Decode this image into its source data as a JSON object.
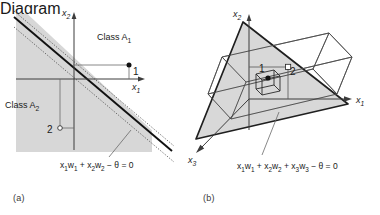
{
  "figure": {
    "background_color": "#ffffff",
    "fill_gray": "#d7d7d7",
    "line_color": "#1a1a1a",
    "panels": [
      {
        "id": "a",
        "caption": "(a)",
        "kind": "2d-linear-separation",
        "axes": [
          {
            "name": "x1-axis",
            "label_html": "x<sub>1</sub>",
            "label_text": "x1",
            "direction": "right"
          },
          {
            "name": "x2-axis",
            "label_html": "x<sub>2</sub>",
            "label_text": "x2",
            "direction": "up"
          }
        ],
        "regions": [
          {
            "name": "class-a1",
            "label_html": "Class A<sub>1</sub>",
            "label_text": "Class A1",
            "side": "upper-right"
          },
          {
            "name": "class-a2",
            "label_html": "Class A<sub>2</sub>",
            "label_text": "Class A2",
            "side": "lower-left"
          }
        ],
        "points": [
          {
            "name": "point-1",
            "label": "1",
            "marker": "filled-dot",
            "class": "A1"
          },
          {
            "name": "point-2",
            "label": "2",
            "marker": "open-dot",
            "class": "A2"
          }
        ],
        "equation_html": "x<sub>1</sub>w<sub>1</sub> + x<sub>2</sub>w<sub>2</sub> &minus; &theta; = 0",
        "equation_text": "x1w1 + x2w2 - θ = 0",
        "decision_line": {
          "name": "decision-boundary-line",
          "style": "solid-thick"
        },
        "margin_lines": {
          "name": "margin-dotted-lines",
          "style": "dotted",
          "count": 2
        }
      },
      {
        "id": "b",
        "caption": "(b)",
        "kind": "3d-linear-separation",
        "axes": [
          {
            "name": "x1-axis",
            "label_html": "x<sub>1</sub>",
            "label_text": "x1",
            "direction": "right"
          },
          {
            "name": "x2-axis",
            "label_html": "x<sub>2</sub>",
            "label_text": "x2",
            "direction": "up"
          },
          {
            "name": "x3-axis",
            "label_html": "x<sub>3</sub>",
            "label_text": "x3",
            "direction": "down-left"
          }
        ],
        "points": [
          {
            "name": "point-1",
            "label": "1",
            "marker": "filled-dot",
            "inside": "small-cube"
          },
          {
            "name": "point-2",
            "label": "2",
            "marker": "open-square"
          }
        ],
        "equation_html": "x<sub>1</sub>w<sub>1</sub> + x<sub>2</sub>w<sub>2</sub> + x<sub>3</sub>w<sub>3</sub> &minus; &theta; = 0",
        "equation_text": "x1w1 + x2w2 + x3w3 - θ = 0",
        "decision_plane": {
          "name": "decision-plane-triangle",
          "style": "shaded-triangle"
        },
        "wireframes": [
          {
            "name": "outer-cube-wireframe",
            "style": "thin-outline"
          },
          {
            "name": "inner-cube-wireframe",
            "style": "thin-outline"
          }
        ],
        "leader_line": {
          "name": "equation-leader-line",
          "style": "thin"
        }
      }
    ]
  }
}
